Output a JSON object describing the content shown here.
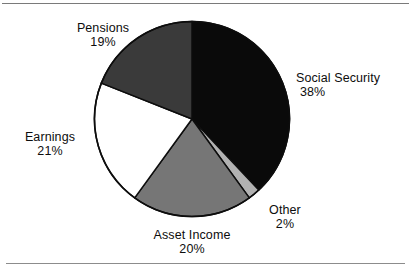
{
  "figure": {
    "background_color": "#ffffff",
    "rule_color": "#7a7a7a"
  },
  "chart_data": {
    "type": "pie",
    "title": "",
    "subtitle": "",
    "xlabel": "",
    "ylabel": "",
    "legend_position": "none",
    "grid": false,
    "start_angle_deg": 0,
    "direction": "clockwise",
    "units": "percent",
    "total": 100,
    "categories": [
      "Social Security",
      "Other",
      "Asset Income",
      "Earnings",
      "Pensions"
    ],
    "values": [
      38,
      2,
      20,
      21,
      19
    ],
    "colors": [
      "#0a0a0a",
      "#b2b2b2",
      "#767676",
      "#ffffff",
      "#3a3a3a"
    ],
    "slices": [
      {
        "label": "Social Security",
        "value": 38,
        "percent_text": "38%",
        "color": "#0a0a0a",
        "start_deg": 0,
        "end_deg": 136.8
      },
      {
        "label": "Other",
        "value": 2,
        "percent_text": "2%",
        "color": "#b2b2b2",
        "start_deg": 136.8,
        "end_deg": 144
      },
      {
        "label": "Asset Income",
        "value": 20,
        "percent_text": "20%",
        "color": "#767676",
        "start_deg": 144,
        "end_deg": 216
      },
      {
        "label": "Earnings",
        "value": 21,
        "percent_text": "21%",
        "color": "#ffffff",
        "start_deg": 216,
        "end_deg": 291.6
      },
      {
        "label": "Pensions",
        "value": 19,
        "percent_text": "19%",
        "color": "#3a3a3a",
        "start_deg": 291.6,
        "end_deg": 360
      }
    ]
  }
}
